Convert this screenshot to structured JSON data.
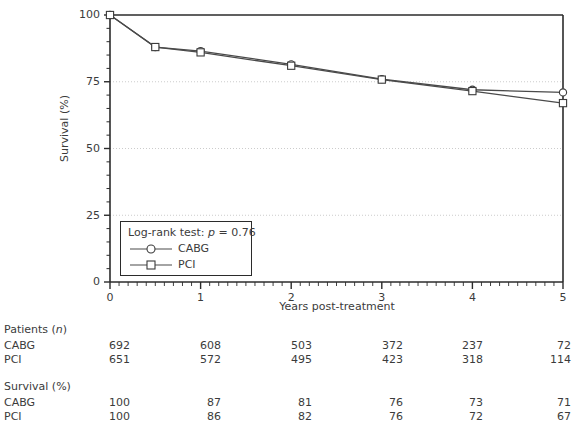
{
  "chart_data": {
    "type": "line",
    "title": "",
    "xlabel": "Years post-treatment",
    "ylabel": "Survival (%)",
    "xlim": [
      0,
      5
    ],
    "ylim": [
      0,
      100
    ],
    "xticks": [
      "0",
      "1",
      "2",
      "3",
      "4",
      "5"
    ],
    "yticks": [
      "0",
      "25",
      "50",
      "75",
      "100"
    ],
    "xtick_minor_step": 0.1,
    "ytick_minor_step": 5,
    "grid": "horizontal dotted gridlines at 25, 50, 75",
    "legend_position": "inside lower-left",
    "annotation": "Log-rank test: p = 0.76",
    "x": [
      0,
      0.5,
      1,
      2,
      3,
      4,
      5
    ],
    "series": [
      {
        "name": "CABG",
        "marker": "circle-open",
        "values": [
          100,
          88,
          86.5,
          81.5,
          76,
          72,
          71
        ]
      },
      {
        "name": "PCI",
        "marker": "square-open",
        "values": [
          100,
          88,
          86,
          81,
          75.8,
          71.5,
          67
        ]
      }
    ]
  },
  "axes": {
    "y_title": "Survival (%)",
    "x_title": "Years post-treatment",
    "y_ticks": [
      "100",
      "75",
      "50",
      "25",
      "0"
    ],
    "x_ticks": [
      "0",
      "1",
      "2",
      "3",
      "4",
      "5"
    ]
  },
  "legend": {
    "pvalue_prefix": "Log-rank test: ",
    "pvalue_italic": "p",
    "pvalue_suffix": " = 0.76",
    "items": [
      {
        "label": "CABG",
        "marker": "circle-open"
      },
      {
        "label": "PCI",
        "marker": "square-open"
      }
    ]
  },
  "tables": [
    {
      "title_text": "Patients (",
      "title_italic": "n",
      "title_suffix": ")",
      "rows": [
        {
          "label": "CABG",
          "values": [
            "692",
            "608",
            "503",
            "372",
            "237",
            "72"
          ]
        },
        {
          "label": "PCI",
          "values": [
            "651",
            "572",
            "495",
            "423",
            "318",
            "114"
          ]
        }
      ]
    },
    {
      "title_text": "Survival (%)",
      "title_italic": "",
      "title_suffix": "",
      "rows": [
        {
          "label": "CABG",
          "values": [
            "100",
            "87",
            "81",
            "76",
            "73",
            "71"
          ]
        },
        {
          "label": "PCI",
          "values": [
            "100",
            "86",
            "82",
            "76",
            "72",
            "67"
          ]
        }
      ]
    }
  ],
  "colors": {
    "axis": "#2b2b2b",
    "line": "#4a4a4a",
    "grid": "#cccccc",
    "text": "#3b3b3b",
    "background": "#ffffff"
  }
}
